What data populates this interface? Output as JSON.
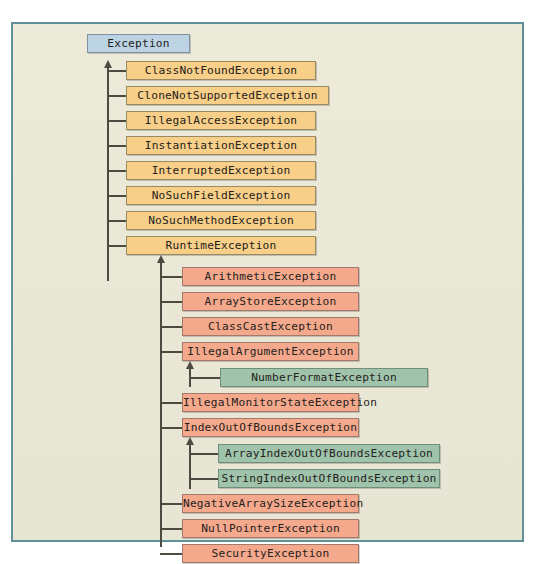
{
  "diagram": {
    "colors": {
      "canvas": "#ece9d8",
      "frame_border": "#5f9199",
      "root_fill": "#bcd3e4",
      "level2_fill": "#f7cf88",
      "level3_fill": "#f4a98c",
      "level4_fill": "#9fc4ab",
      "connector": "#4e4a42"
    },
    "root": {
      "label": "Exception"
    },
    "level2": [
      {
        "label": "ClassNotFoundException"
      },
      {
        "label": "CloneNotSupportedException"
      },
      {
        "label": "IllegalAccessException"
      },
      {
        "label": "InstantiationException"
      },
      {
        "label": "InterruptedException"
      },
      {
        "label": "NoSuchFieldException"
      },
      {
        "label": "NoSuchMethodException"
      },
      {
        "label": "RuntimeException"
      }
    ],
    "level3": [
      {
        "label": "ArithmeticException"
      },
      {
        "label": "ArrayStoreException"
      },
      {
        "label": "ClassCastException"
      },
      {
        "label": "IllegalArgumentException"
      },
      {
        "label": "IllegalMonitorStateException"
      },
      {
        "label": "IndexOutOfBoundsException"
      },
      {
        "label": "NegativeArraySizeException"
      },
      {
        "label": "NullPointerException"
      },
      {
        "label": "SecurityException"
      }
    ],
    "level4_illegal_argument": [
      {
        "label": "NumberFormatException"
      }
    ],
    "level4_index_out_of_bounds": [
      {
        "label": "ArrayIndexOutOfBoundsException"
      },
      {
        "label": "StringIndexOutOfBoundsException"
      }
    ]
  }
}
